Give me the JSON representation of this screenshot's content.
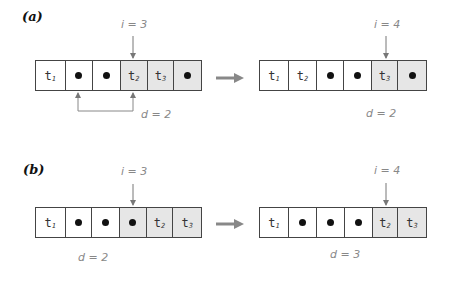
{
  "panels": [
    {
      "label": "(a)",
      "before": {
        "index_label": "i = 3",
        "distance_label": "d = 2",
        "cells": [
          {
            "kind": "token",
            "text": "t",
            "sub": "1",
            "shaded": false
          },
          {
            "kind": "dot",
            "shaded": false
          },
          {
            "kind": "dot",
            "shaded": false
          },
          {
            "kind": "token",
            "text": "t",
            "sub": "2",
            "shaded": true
          },
          {
            "kind": "token",
            "text": "t",
            "sub": "3",
            "shaded": true
          },
          {
            "kind": "dot",
            "shaded": true
          }
        ]
      },
      "after": {
        "index_label": "i = 4",
        "distance_label": "d = 2",
        "cells": [
          {
            "kind": "token",
            "text": "t",
            "sub": "1",
            "shaded": false
          },
          {
            "kind": "token",
            "text": "t",
            "sub": "2",
            "shaded": false
          },
          {
            "kind": "dot",
            "shaded": false
          },
          {
            "kind": "dot",
            "shaded": false
          },
          {
            "kind": "token",
            "text": "t",
            "sub": "3",
            "shaded": true
          },
          {
            "kind": "dot",
            "shaded": true
          }
        ]
      }
    },
    {
      "label": "(b)",
      "before": {
        "index_label": "i = 3",
        "distance_label": "d = 2",
        "cells": [
          {
            "kind": "token",
            "text": "t",
            "sub": "1",
            "shaded": false
          },
          {
            "kind": "dot",
            "shaded": false
          },
          {
            "kind": "dot",
            "shaded": false
          },
          {
            "kind": "dot",
            "shaded": true
          },
          {
            "kind": "token",
            "text": "t",
            "sub": "2",
            "shaded": true
          },
          {
            "kind": "token",
            "text": "t",
            "sub": "3",
            "shaded": true
          }
        ]
      },
      "after": {
        "index_label": "i = 4",
        "distance_label": "d = 3",
        "cells": [
          {
            "kind": "token",
            "text": "t",
            "sub": "1",
            "shaded": false
          },
          {
            "kind": "dot",
            "shaded": false
          },
          {
            "kind": "dot",
            "shaded": false
          },
          {
            "kind": "dot",
            "shaded": false
          },
          {
            "kind": "token",
            "text": "t",
            "sub": "2",
            "shaded": true
          },
          {
            "kind": "token",
            "text": "t",
            "sub": "3",
            "shaded": true
          }
        ]
      }
    }
  ],
  "colors": {
    "border": "#444444",
    "shade": "#e6e6e6",
    "annotation": "#888888",
    "arrow": "#777777"
  }
}
